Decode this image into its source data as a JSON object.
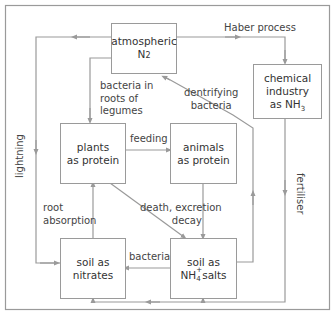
{
  "diagram": {
    "colors": {
      "line": "#9a9a9a",
      "text": "#333333",
      "frame": "#9a9a9a"
    },
    "nodes": {
      "atmospheric": {
        "line1": "atmospheric",
        "line2": "N",
        "sub": "2"
      },
      "chemical": {
        "line1": "chemical",
        "line2": "industry",
        "line3": "as NH",
        "sub": "3"
      },
      "plants": {
        "line1": "plants",
        "line2": "as protein"
      },
      "animals": {
        "line1": "animals",
        "line2": "as protein"
      },
      "nitrates": {
        "line1": "soil as",
        "line2": "nitrates"
      },
      "ammonium": {
        "line1": "soil as",
        "line2_pre": "NH",
        "sub": "4",
        "sup": "+",
        "line2_post": "salts"
      }
    },
    "edges": {
      "haber": "Haber process",
      "bacteria_legumes_1": "bacteria in",
      "bacteria_legumes_2": "roots of",
      "bacteria_legumes_3": "legumes",
      "denitrifying_1": "dentrifying",
      "denitrifying_2": "bacteria",
      "feeding": "feeding",
      "lightning": "lightning",
      "fertiliser": "fertiliser",
      "root_absorption_1": "root",
      "root_absorption_2": "absorption",
      "death_1": "death, excretion",
      "death_2": "decay",
      "bacteria": "bacteria"
    }
  }
}
